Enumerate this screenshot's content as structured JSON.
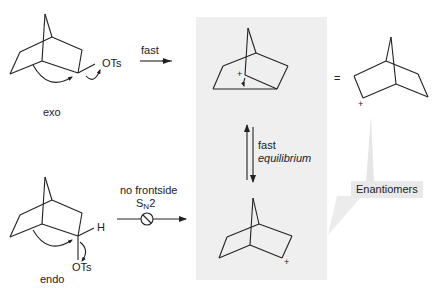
{
  "diagram": {
    "type": "reaction-scheme",
    "topic": "2-norbornyl cation formation from exo and endo norbornyl tosylates",
    "colors": {
      "panel_background": "#efefef",
      "callout_background": "#e9e9e9",
      "stroke": "#222222"
    },
    "labels": {
      "exo": "exo",
      "endo": "endo",
      "exo_leaving_group": "OTs",
      "endo_leaving_group": "OTs",
      "endo_hydrogen": "H",
      "fast": "fast",
      "no_frontside": "no frontside",
      "sn2_prefix": "S",
      "sn2_sub": "N",
      "sn2_suffix": "2",
      "equilibrium_fast": "fast",
      "equilibrium": "equilibrium",
      "equals": "=",
      "plus": "+",
      "callout": "Enantiomers"
    },
    "nodes": [
      {
        "id": "exo-tosylate",
        "label": "exo"
      },
      {
        "id": "endo-tosylate",
        "label": "endo"
      },
      {
        "id": "bridged-cation",
        "label": "nonclassical (bridged) cation"
      },
      {
        "id": "classical-cation-top",
        "label": "2-norbornyl cation"
      },
      {
        "id": "classical-cation-bottom",
        "label": "2-norbornyl cation"
      }
    ],
    "edges": [
      {
        "from": "exo-tosylate",
        "to": "bridged-cation",
        "label": "fast"
      },
      {
        "from": "endo-tosylate",
        "to": "classical-cation-bottom",
        "label": "no frontside SN2 (blocked)"
      },
      {
        "from": "bridged-cation",
        "to": "classical-cation-bottom",
        "label": "fast equilibrium",
        "bidirectional": true
      },
      {
        "from": "bridged-cation",
        "to": "classical-cation-top",
        "label": "="
      }
    ]
  }
}
